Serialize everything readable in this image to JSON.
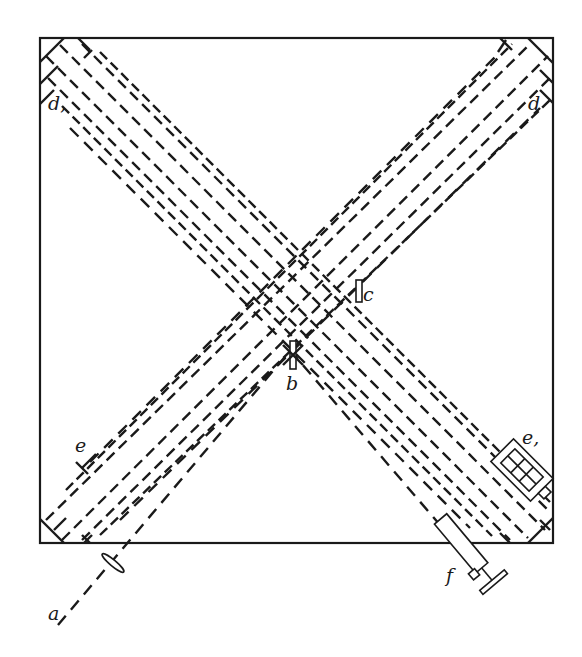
{
  "figure": {
    "title": "",
    "colors": {
      "ink": "#1a1a1a",
      "background": "#ffffff"
    }
  },
  "labels": {
    "source": "a",
    "plate_b": "b",
    "plate_c": "c",
    "mirror_d_right": "d",
    "mirror_d_left": "d,",
    "mirror_e": "e",
    "mirror_e1": "e,",
    "telescope": "f"
  },
  "components": [
    {
      "id": "a",
      "name": "light source / lens",
      "position": "bottom-left, outside frame"
    },
    {
      "id": "b",
      "name": "half-silvered plate",
      "position": "center"
    },
    {
      "id": "c",
      "name": "compensating plate",
      "position": "center-right"
    },
    {
      "id": "d",
      "name": "mirror group",
      "position": "top-right corner"
    },
    {
      "id": "d,",
      "name": "mirror group",
      "position": "top-left corner"
    },
    {
      "id": "e",
      "name": "adjustable mirror",
      "position": "lower-left"
    },
    {
      "id": "e,",
      "name": "adjustable mirror with screw",
      "position": "lower-right"
    },
    {
      "id": "f",
      "name": "observing telescope",
      "position": "bottom-right, outside frame"
    }
  ]
}
